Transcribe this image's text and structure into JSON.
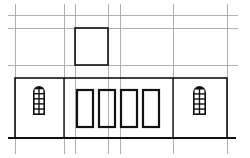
{
  "diagram": {
    "type": "building-elevation",
    "colors": {
      "grid": "#b0b0b0",
      "outline": "#111111",
      "background": "#ffffff"
    },
    "grid": {
      "vertical_x": [
        15,
        64,
        75,
        108,
        120,
        173,
        227
      ],
      "horizontal_y": [
        15,
        28,
        65
      ]
    },
    "ground_line": {
      "x1": 8,
      "x2": 236,
      "y": 138
    },
    "building": {
      "x": 15,
      "y": 78,
      "width": 212,
      "height": 60,
      "dividers_x": [
        64,
        173
      ]
    },
    "upper_box": {
      "x": 75,
      "y": 28,
      "width": 33,
      "height": 37
    },
    "doors": [
      {
        "x": 77,
        "y": 90,
        "width": 16,
        "height": 37
      },
      {
        "x": 99,
        "y": 90,
        "width": 16,
        "height": 37
      },
      {
        "x": 121,
        "y": 90,
        "width": 16,
        "height": 37
      },
      {
        "x": 143,
        "y": 90,
        "width": 16,
        "height": 37
      }
    ],
    "arched_windows": [
      {
        "x": 33,
        "y": 86,
        "width": 12,
        "height": 29
      },
      {
        "x": 193,
        "y": 86,
        "width": 13,
        "height": 29
      }
    ]
  }
}
